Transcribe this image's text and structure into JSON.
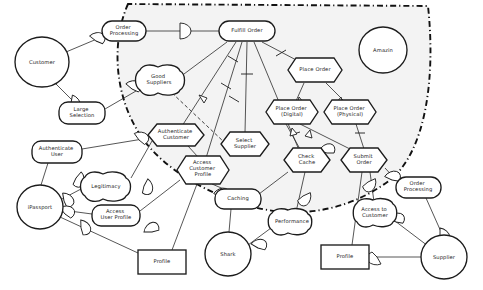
{
  "diagram": {
    "colors": {
      "boundary_fill": "#f3f3f3",
      "stroke": "#1c1c1c",
      "edge": "#2b2b2b",
      "node_fill": "#ffffff"
    },
    "boundary": {
      "name": "system-boundary",
      "style": "dash-dot"
    },
    "nodes": [
      {
        "id": "customer",
        "label": "Customer",
        "type": "actor-circle",
        "x": 42,
        "y": 62,
        "rx": 27,
        "ry": 25
      },
      {
        "id": "order-processing-l",
        "label": "Order\nProcessing",
        "type": "softgoal",
        "x": 124,
        "y": 31,
        "w": 44,
        "h": 20
      },
      {
        "id": "fulfill-order",
        "label": "Fulfill Order",
        "type": "goal",
        "x": 247,
        "y": 31,
        "w": 56,
        "h": 20
      },
      {
        "id": "amazin",
        "label": "Amazin",
        "type": "actor-circle",
        "x": 383,
        "y": 50,
        "rx": 24,
        "ry": 23
      },
      {
        "id": "good-suppliers",
        "label": "Good\nSuppliers",
        "type": "cloud",
        "x": 159,
        "y": 80,
        "w": 50,
        "h": 24
      },
      {
        "id": "large-selection",
        "label": "Large\nSelection",
        "type": "goal",
        "x": 82,
        "y": 113,
        "w": 46,
        "h": 22
      },
      {
        "id": "place-order",
        "label": "Place Order",
        "type": "task-hex",
        "x": 315,
        "y": 70,
        "w": 54,
        "h": 24
      },
      {
        "id": "place-order-digital",
        "label": "Place Order\n(Digital)",
        "type": "task-hex",
        "x": 292,
        "y": 112,
        "w": 52,
        "h": 24
      },
      {
        "id": "place-order-physical",
        "label": "Place Order\n(Physical)",
        "type": "task-hex",
        "x": 350,
        "y": 112,
        "w": 52,
        "h": 24
      },
      {
        "id": "authenticate-customer",
        "label": "Authenticate\nCustomer",
        "type": "task-hex",
        "x": 176,
        "y": 135,
        "w": 56,
        "h": 23
      },
      {
        "id": "select-supplier",
        "label": "Select\nSupplier",
        "type": "task-hex",
        "x": 245,
        "y": 144,
        "w": 47,
        "h": 24
      },
      {
        "id": "check-cache",
        "label": "Check\nCache",
        "type": "task-hex",
        "x": 307,
        "y": 160,
        "w": 45,
        "h": 24
      },
      {
        "id": "submit-order",
        "label": "Submit\nOrder",
        "type": "task-hex",
        "x": 364,
        "y": 160,
        "w": 45,
        "h": 24
      },
      {
        "id": "authenticate-user",
        "label": "Authenticate\nUser",
        "type": "goal",
        "x": 57,
        "y": 152,
        "w": 50,
        "h": 22
      },
      {
        "id": "access-customer-profile",
        "label": "Access\nCustomer\nProfile",
        "type": "task-hex",
        "x": 203,
        "y": 170,
        "w": 52,
        "h": 28
      },
      {
        "id": "legitimacy",
        "label": "Legitimacy",
        "type": "cloud",
        "x": 106,
        "y": 186,
        "w": 50,
        "h": 22
      },
      {
        "id": "ipassport",
        "label": "iPassport",
        "type": "actor-circle",
        "x": 40,
        "y": 207,
        "rx": 23,
        "ry": 22
      },
      {
        "id": "caching",
        "label": "Caching",
        "type": "goal",
        "x": 238,
        "y": 199,
        "w": 46,
        "h": 20
      },
      {
        "id": "order-processing-r",
        "label": "Order\nProcessing",
        "type": "goal",
        "x": 418,
        "y": 187,
        "w": 45,
        "h": 21
      },
      {
        "id": "access-user-profile",
        "label": "Access\nUser Profile",
        "type": "goal",
        "x": 116,
        "y": 215,
        "w": 48,
        "h": 21
      },
      {
        "id": "performance",
        "label": "Performance",
        "type": "cloud",
        "x": 292,
        "y": 222,
        "w": 48,
        "h": 21
      },
      {
        "id": "access-to-customer",
        "label": "Access to\nCustomer",
        "type": "cloud",
        "x": 376,
        "y": 213,
        "w": 46,
        "h": 22
      },
      {
        "id": "profile-left",
        "label": "Profile",
        "type": "resource-rect",
        "x": 162,
        "y": 262,
        "w": 48,
        "h": 24
      },
      {
        "id": "shark",
        "label": "Shark",
        "type": "actor-circle",
        "x": 228,
        "y": 254,
        "rx": 23,
        "ry": 22
      },
      {
        "id": "profile-right",
        "label": "Profile",
        "type": "resource-rect",
        "x": 345,
        "y": 257,
        "w": 48,
        "h": 24
      },
      {
        "id": "supplier",
        "label": "Supplier",
        "type": "actor-circle",
        "x": 444,
        "y": 257,
        "rx": 23,
        "ry": 22
      }
    ],
    "link_kinds": {
      "means-ends": "open-arrowhead",
      "decomposition": "tick-mark",
      "dependency": "D-shaped-depender-link",
      "contribution": "dashed-arrow"
    }
  }
}
